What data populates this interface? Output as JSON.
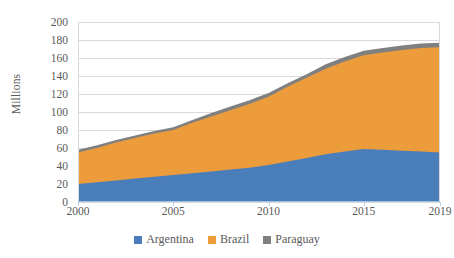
{
  "chart_data": {
    "type": "area",
    "stacked": true,
    "title": "",
    "subtitle": "",
    "xlabel": "",
    "ylabel": "Millions",
    "x": [
      2000,
      2001,
      2002,
      2003,
      2004,
      2005,
      2006,
      2007,
      2008,
      2009,
      2010,
      2011,
      2012,
      2013,
      2014,
      2015,
      2016,
      2017,
      2018,
      2019
    ],
    "tick_labels_x": [
      "2000",
      "2005",
      "2010",
      "2015",
      "2019"
    ],
    "tick_values_x": [
      2000,
      2005,
      2010,
      2015,
      2019
    ],
    "tick_labels_y": [
      "0",
      "20",
      "40",
      "60",
      "80",
      "100",
      "120",
      "140",
      "160",
      "180",
      "200"
    ],
    "tick_values_y": [
      0,
      20,
      40,
      60,
      80,
      100,
      120,
      140,
      160,
      180,
      200
    ],
    "ylim": [
      0,
      200
    ],
    "xlim": [
      2000,
      2019
    ],
    "grid": "horizontal",
    "legend_position": "bottom",
    "series": [
      {
        "name": "Argentina",
        "color": "#4a7ebb",
        "values": [
          20,
          22,
          24,
          26,
          28,
          30,
          32,
          34,
          36,
          38,
          41,
          45,
          49,
          53,
          56,
          59,
          58,
          57,
          56,
          55
        ]
      },
      {
        "name": "Brazil",
        "color": "#ed9c3c",
        "values": [
          35,
          38,
          42,
          45,
          48,
          50,
          56,
          61,
          66,
          71,
          76,
          83,
          89,
          95,
          100,
          104,
          108,
          112,
          115,
          117
        ]
      },
      {
        "name": "Paraguay",
        "color": "#808080",
        "values": [
          3,
          3,
          3,
          3,
          3,
          3,
          3,
          4,
          4,
          4,
          4,
          4,
          4,
          5,
          5,
          5,
          5,
          5,
          5,
          5
        ]
      }
    ],
    "stacked_totals": [
      58,
      63,
      69,
      74,
      79,
      83,
      91,
      99,
      106,
      113,
      121,
      132,
      142,
      153,
      161,
      168,
      171,
      174,
      176,
      177
    ],
    "colors": {
      "argentina": "#4a7ebb",
      "brazil": "#ed9c3c",
      "paraguay": "#808080",
      "gridline": "#d9d9d9",
      "axis": "#9ec3e8",
      "text": "#595959",
      "background": "#ffffff"
    }
  },
  "axis": {
    "y_title": "Millions"
  },
  "legend": {
    "items": [
      {
        "label": "Argentina",
        "color": "#4a7ebb"
      },
      {
        "label": "Brazil",
        "color": "#ed9c3c"
      },
      {
        "label": "Paraguay",
        "color": "#808080"
      }
    ]
  }
}
